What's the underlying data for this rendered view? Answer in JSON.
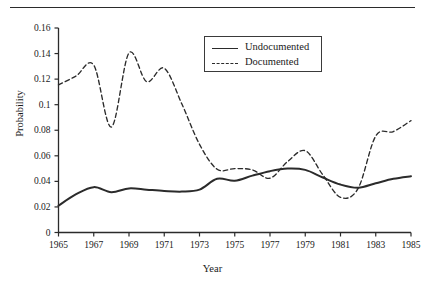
{
  "chart_data": {
    "type": "line",
    "title": "",
    "xlabel": "Year",
    "ylabel": "Probability",
    "xlim": [
      1965,
      1985
    ],
    "ylim": [
      0,
      0.16
    ],
    "grid": false,
    "legend_position": "top-center",
    "xticks": [
      "1965",
      "1967",
      "1969",
      "1971",
      "1973",
      "1975",
      "1977",
      "1979",
      "1981",
      "1983",
      "1985"
    ],
    "xtick_values": [
      1965,
      1967,
      1969,
      1971,
      1973,
      1975,
      1977,
      1979,
      1981,
      1983,
      1985
    ],
    "yticks": [
      "0",
      "0.02",
      "0.04",
      "0.06",
      "0.08",
      "0.1",
      "0.12",
      "0.14",
      "0.16"
    ],
    "ytick_values": [
      0,
      0.02,
      0.04,
      0.06,
      0.08,
      0.1,
      0.12,
      0.14,
      0.16
    ],
    "x": [
      1965,
      1966,
      1967,
      1968,
      1969,
      1970,
      1971,
      1972,
      1973,
      1974,
      1975,
      1976,
      1977,
      1978,
      1979,
      1980,
      1981,
      1982,
      1983,
      1984,
      1985
    ],
    "series": [
      {
        "name": "Undocumented",
        "style": "solid",
        "color": "#2b2b2b",
        "values": [
          0.021,
          0.03,
          0.0355,
          0.0315,
          0.0345,
          0.0335,
          0.0325,
          0.032,
          0.0335,
          0.042,
          0.0405,
          0.0445,
          0.048,
          0.05,
          0.049,
          0.043,
          0.0375,
          0.035,
          0.0385,
          0.042,
          0.044
        ]
      },
      {
        "name": "Documented",
        "style": "dashed",
        "color": "#2b2b2b",
        "values": [
          0.1155,
          0.1225,
          0.131,
          0.0825,
          0.1405,
          0.118,
          0.1285,
          0.1005,
          0.069,
          0.0495,
          0.05,
          0.049,
          0.0425,
          0.0555,
          0.064,
          0.045,
          0.0275,
          0.0345,
          0.0755,
          0.079,
          0.0875
        ]
      }
    ]
  },
  "legend": {
    "entries": [
      {
        "label": "Undocumented",
        "style": "solid"
      },
      {
        "label": "Documented",
        "style": "dashed"
      }
    ]
  }
}
